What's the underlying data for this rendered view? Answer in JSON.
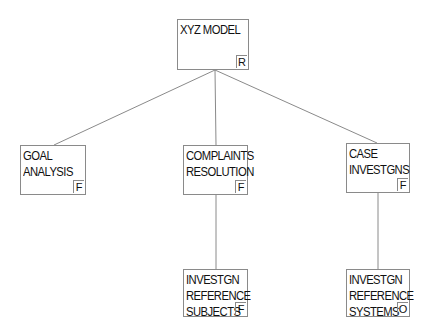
{
  "diagram": {
    "type": "hierarchy-tree",
    "line_color": "#8a8a8a",
    "nodes": [
      {
        "id": "root",
        "label": "XYZ MODEL",
        "badge": "R",
        "x": 177,
        "y": 19,
        "w": 72,
        "h": 51
      },
      {
        "id": "goal",
        "label": "GOAL\nANALYSIS",
        "badge": "F",
        "x": 20,
        "y": 145,
        "w": 66,
        "h": 50
      },
      {
        "id": "complaints",
        "label": "COMPLAINTS\nRESOLUTION",
        "badge": "F",
        "x": 183,
        "y": 145,
        "w": 65,
        "h": 50
      },
      {
        "id": "case",
        "label": "CASE\nINVESTGNS",
        "badge": "F",
        "x": 346,
        "y": 143,
        "w": 64,
        "h": 50
      },
      {
        "id": "subjects",
        "label": "INVESTGN\nREFERENCE\nSUBJECTS",
        "badge": "F",
        "x": 183,
        "y": 269,
        "w": 65,
        "h": 48
      },
      {
        "id": "systems",
        "label": "INVESTGN\nREFERENCE\nSYSTEMS",
        "badge": "O",
        "x": 346,
        "y": 269,
        "w": 64,
        "h": 48
      }
    ],
    "edges": [
      {
        "from": "root",
        "to": "goal",
        "x1": 215,
        "y1": 70,
        "x2": 54,
        "y2": 145
      },
      {
        "from": "root",
        "to": "complaints",
        "x1": 215,
        "y1": 70,
        "x2": 216,
        "y2": 145
      },
      {
        "from": "root",
        "to": "case",
        "x1": 215,
        "y1": 70,
        "x2": 377,
        "y2": 143
      },
      {
        "from": "complaints",
        "to": "subjects",
        "x1": 216,
        "y1": 195,
        "x2": 216,
        "y2": 269
      },
      {
        "from": "case",
        "to": "systems",
        "x1": 378,
        "y1": 193,
        "x2": 378,
        "y2": 269
      }
    ]
  }
}
